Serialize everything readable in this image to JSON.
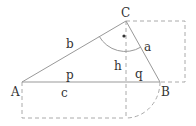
{
  "diagram": {
    "vertices": {
      "A": {
        "label": "A",
        "x": 22,
        "y": 82
      },
      "B": {
        "label": "B",
        "x": 160,
        "y": 82
      },
      "C": {
        "label": "C",
        "x": 126,
        "y": 21
      }
    },
    "sides": {
      "a": "a",
      "b": "b",
      "c": "c",
      "h": "h",
      "p": "p",
      "q": "q"
    },
    "colors": {
      "line": "#999999",
      "dashed": "#aaaaaa",
      "text": "#333333"
    }
  }
}
